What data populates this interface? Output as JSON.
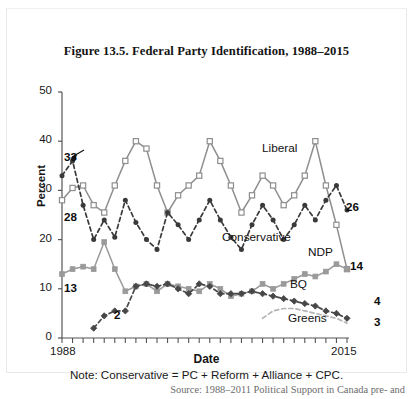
{
  "figure": {
    "title": "Figure 13.5. Federal Party Identification, 1988–2015",
    "note": "Note: Conservative = PC + Reform + Alliance + CPC.",
    "source": "Source: 1988–2011 Political Support in Canada pre- and"
  },
  "labels": {
    "liberal": "Liberal",
    "conservative": "Conservative",
    "ndp": "NDP",
    "bq": "BQ",
    "greens": "Greens"
  },
  "annotations": {
    "lib_start": "28",
    "con_start": "33",
    "ndp_start": "13",
    "bq_start": "2",
    "con_end": "26",
    "ndp_end": "14",
    "bq_end": "4",
    "green_end": "3"
  },
  "axis": {
    "y_ticks": [
      "50",
      "40",
      "30",
      "20",
      "10",
      "0"
    ],
    "x_ticks": [
      "1988",
      "2015"
    ]
  },
  "colors": {
    "liberal": "#8e8e8e",
    "conservative": "#3a3a3a",
    "ndp": "#9a9a9a",
    "bq": "#474747",
    "greens": "#b4b4b4",
    "axis": "#555555",
    "text": "#141414"
  },
  "chart_data": {
    "type": "line",
    "title": "Figure 13.5. Federal Party Identification, 1988–2015",
    "xlabel": "Date",
    "ylabel": "Percent",
    "ylim": [
      0,
      50
    ],
    "yticks": [
      0,
      10,
      20,
      30,
      40,
      50
    ],
    "xlim": [
      1988,
      2015
    ],
    "xticks": [
      1988,
      2015
    ],
    "grid": false,
    "legend": "inline-annotations",
    "note": "Note: Conservative = PC + Reform + Alliance + CPC.",
    "x": [
      1988,
      1989,
      1990,
      1991,
      1992,
      1993,
      1994,
      1995,
      1996,
      1997,
      1998,
      1999,
      2000,
      2001,
      2002,
      2003,
      2004,
      2005,
      2006,
      2007,
      2008,
      2009,
      2010,
      2011,
      2012,
      2013,
      2014,
      2015
    ],
    "series": [
      {
        "name": "Liberal",
        "marker": "open-square",
        "line": "solid",
        "color": "#8e8e8e",
        "start_value": 28,
        "end_value": 14,
        "values": [
          28,
          30.5,
          31,
          27,
          25.5,
          31,
          36,
          40,
          38.5,
          31,
          25.5,
          29,
          31,
          33,
          40,
          36,
          31,
          25.5,
          29,
          33,
          31,
          27,
          29,
          33,
          40,
          31,
          23,
          14
        ]
      },
      {
        "name": "Conservative",
        "marker": "filled-circle",
        "line": "dashed",
        "color": "#3a3a3a",
        "start_value": 33,
        "end_value": 26,
        "values": [
          33,
          36,
          27,
          20,
          24,
          20.5,
          28,
          23.5,
          20,
          18,
          25.5,
          23,
          20,
          24,
          28,
          24,
          20.5,
          18,
          23,
          27,
          24,
          20,
          23,
          27,
          24,
          28,
          31,
          26
        ]
      },
      {
        "name": "NDP",
        "marker": "filled-square",
        "line": "solid",
        "color": "#9a9a9a",
        "start_value": 13,
        "end_value": 14,
        "values": [
          13,
          14,
          14.5,
          14,
          19.5,
          14,
          9.5,
          10.5,
          11,
          9.5,
          11,
          10.5,
          10,
          9.5,
          11,
          10,
          8.5,
          9,
          9.5,
          11,
          10,
          11,
          12,
          13,
          12.5,
          13.5,
          15,
          14
        ]
      },
      {
        "name": "BQ",
        "marker": "filled-diamond",
        "line": "dashed",
        "color": "#474747",
        "start_value": 2,
        "end_value": 4,
        "values": [
          null,
          null,
          null,
          2,
          4.5,
          5.5,
          5.5,
          10.5,
          11,
          10.5,
          11,
          10,
          9,
          11,
          10.5,
          9,
          9,
          9,
          9.5,
          9,
          8.5,
          8,
          7.5,
          7,
          6.5,
          5.5,
          5,
          4
        ]
      },
      {
        "name": "Greens",
        "marker": "none",
        "line": "dashed",
        "color": "#b4b4b4",
        "start_value": 4,
        "end_value": 3,
        "values": [
          null,
          null,
          null,
          null,
          null,
          null,
          null,
          null,
          null,
          null,
          null,
          null,
          null,
          null,
          null,
          null,
          null,
          null,
          null,
          4,
          5.5,
          6,
          6,
          5.5,
          5,
          4.5,
          4,
          3
        ]
      }
    ]
  }
}
